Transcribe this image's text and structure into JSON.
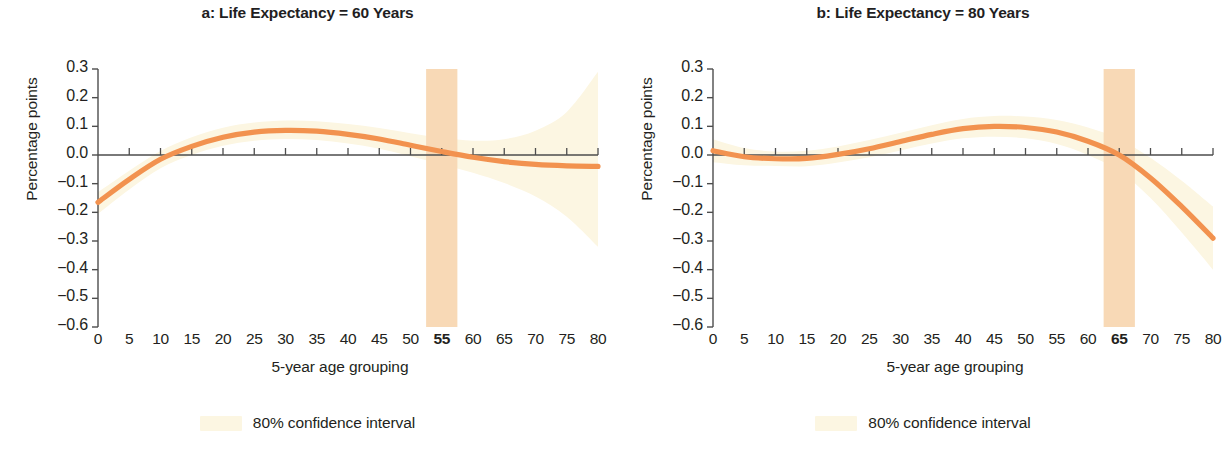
{
  "figure": {
    "panels": [
      {
        "key": "a",
        "title": "a: Life Expectancy = 60 Years",
        "highlight_label": "55",
        "legend_label": "80% confidence interval"
      },
      {
        "key": "b",
        "title": "b: Life Expectancy = 80 Years",
        "highlight_label": "65",
        "legend_label": "80% confidence interval"
      }
    ],
    "colors": {
      "curve": "#F2924F",
      "ci_band": "#FCF6E2",
      "highlight_band": "#F8D9B6",
      "axis": "#4d4d4d",
      "text": "#231f20"
    }
  },
  "chart_data": [
    {
      "type": "line",
      "title": "a: Life Expectancy = 60 Years",
      "xlabel": "5-year age grouping",
      "ylabel": "Percentage points",
      "xlim": [
        0,
        80
      ],
      "ylim": [
        -0.6,
        0.3
      ],
      "xticks": [
        0,
        5,
        10,
        15,
        20,
        25,
        30,
        35,
        40,
        45,
        50,
        55,
        60,
        65,
        70,
        75,
        80
      ],
      "xtick_labels": [
        "0",
        "5",
        "10",
        "15",
        "20",
        "25",
        "30",
        "35",
        "40",
        "45",
        "50",
        "55",
        "60",
        "65",
        "70",
        "75",
        "80"
      ],
      "yticks": [
        0.3,
        0.2,
        0.1,
        0.0,
        -0.1,
        -0.2,
        -0.3,
        -0.4,
        -0.5,
        -0.6
      ],
      "ytick_labels": [
        "0.3",
        "0.2",
        "0.1",
        "0.0",
        "−0.1",
        "−0.2",
        "−0.3",
        "−0.4",
        "−0.5",
        "−0.6"
      ],
      "grid": false,
      "legend": {
        "position": "below",
        "entries": [
          "80% confidence interval"
        ]
      },
      "highlight_band": {
        "x_start": 52.5,
        "x_end": 57.5,
        "label": "55"
      },
      "zero_line": 0.0,
      "series": [
        {
          "name": "Estimate",
          "x": [
            0,
            5,
            10,
            15,
            20,
            25,
            30,
            35,
            40,
            45,
            50,
            55,
            60,
            65,
            70,
            75,
            80
          ],
          "values": [
            -0.165,
            -0.085,
            -0.015,
            0.03,
            0.062,
            0.08,
            0.086,
            0.083,
            0.072,
            0.056,
            0.034,
            0.012,
            -0.008,
            -0.023,
            -0.033,
            -0.038,
            -0.04
          ]
        },
        {
          "name": "80% CI upper",
          "x": [
            0,
            5,
            10,
            15,
            20,
            25,
            30,
            35,
            40,
            45,
            50,
            55,
            60,
            65,
            70,
            75,
            80
          ],
          "values": [
            -0.13,
            -0.055,
            0.014,
            0.062,
            0.095,
            0.113,
            0.12,
            0.118,
            0.108,
            0.094,
            0.076,
            0.06,
            0.05,
            0.055,
            0.085,
            0.15,
            0.29
          ]
        },
        {
          "name": "80% CI lower",
          "x": [
            0,
            5,
            10,
            15,
            20,
            25,
            30,
            35,
            40,
            45,
            50,
            55,
            60,
            65,
            70,
            75,
            80
          ],
          "values": [
            -0.205,
            -0.12,
            -0.046,
            0.0,
            0.032,
            0.05,
            0.056,
            0.052,
            0.04,
            0.022,
            -0.004,
            -0.032,
            -0.062,
            -0.098,
            -0.145,
            -0.215,
            -0.32
          ]
        }
      ]
    },
    {
      "type": "line",
      "title": "b: Life Expectancy = 80 Years",
      "xlabel": "5-year age grouping",
      "ylabel": "Percentage points",
      "xlim": [
        0,
        80
      ],
      "ylim": [
        -0.6,
        0.3
      ],
      "xticks": [
        0,
        5,
        10,
        15,
        20,
        25,
        30,
        35,
        40,
        45,
        50,
        55,
        60,
        65,
        70,
        75,
        80
      ],
      "xtick_labels": [
        "0",
        "5",
        "10",
        "15",
        "20",
        "25",
        "30",
        "35",
        "40",
        "45",
        "50",
        "55",
        "60",
        "65",
        "70",
        "75",
        "80"
      ],
      "yticks": [
        0.3,
        0.2,
        0.1,
        0.0,
        -0.1,
        -0.2,
        -0.3,
        -0.4,
        -0.5,
        -0.6
      ],
      "ytick_labels": [
        "0.3",
        "0.2",
        "0.1",
        "0.0",
        "−0.1",
        "−0.2",
        "−0.3",
        "−0.4",
        "−0.5",
        "−0.6"
      ],
      "grid": false,
      "legend": {
        "position": "below",
        "entries": [
          "80% confidence interval"
        ]
      },
      "highlight_band": {
        "x_start": 62.5,
        "x_end": 67.5,
        "label": "65"
      },
      "zero_line": 0.0,
      "series": [
        {
          "name": "Estimate",
          "x": [
            0,
            5,
            10,
            15,
            20,
            25,
            30,
            35,
            40,
            45,
            50,
            55,
            60,
            65,
            70,
            75,
            80
          ],
          "values": [
            0.015,
            -0.006,
            -0.013,
            -0.012,
            0.002,
            0.022,
            0.047,
            0.072,
            0.092,
            0.1,
            0.096,
            0.08,
            0.048,
            0.0,
            -0.08,
            -0.18,
            -0.29
          ]
        },
        {
          "name": "80% CI upper",
          "x": [
            0,
            5,
            10,
            15,
            20,
            25,
            30,
            35,
            40,
            45,
            50,
            55,
            60,
            65,
            70,
            75,
            80
          ],
          "values": [
            0.055,
            0.024,
            0.012,
            0.015,
            0.03,
            0.052,
            0.078,
            0.104,
            0.126,
            0.136,
            0.134,
            0.122,
            0.096,
            0.056,
            -0.01,
            -0.09,
            -0.18
          ]
        },
        {
          "name": "80% CI lower",
          "x": [
            0,
            5,
            10,
            15,
            20,
            25,
            30,
            35,
            40,
            45,
            50,
            55,
            60,
            65,
            70,
            75,
            80
          ],
          "values": [
            -0.025,
            -0.036,
            -0.038,
            -0.039,
            -0.026,
            -0.008,
            0.016,
            0.04,
            0.058,
            0.064,
            0.058,
            0.038,
            0.0,
            -0.056,
            -0.15,
            -0.27,
            -0.4
          ]
        }
      ]
    }
  ]
}
